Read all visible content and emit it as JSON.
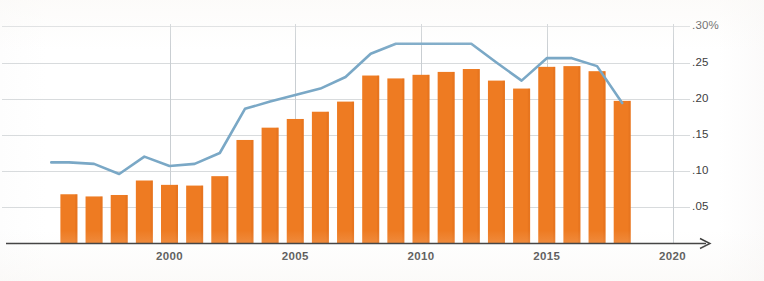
{
  "chart_data": {
    "type": "bar",
    "title": "",
    "subtitle": "",
    "xlabel": "",
    "ylabel": "",
    "grid": true,
    "legend": "none",
    "xlim": [
      1995.2,
      2021.0
    ],
    "ylim": [
      0.0,
      0.305
    ],
    "y_ticks": [
      0.05,
      0.1,
      0.15,
      0.2,
      0.25,
      0.3
    ],
    "y_tick_labels": [
      ".05",
      ".10",
      ".15",
      ".20",
      ".25",
      ".30%"
    ],
    "x_ticks": [
      2000,
      2005,
      2010,
      2015,
      2020
    ],
    "x_tick_labels": [
      "2000",
      "2005",
      "2010",
      "2015",
      "2020"
    ],
    "categories": [
      1996,
      1997,
      1998,
      1999,
      2000,
      2001,
      2002,
      2003,
      2004,
      2005,
      2006,
      2007,
      2008,
      2009,
      2010,
      2011,
      2012,
      2013,
      2014,
      2015,
      2016,
      2017,
      2018
    ],
    "series": [
      {
        "name": "bars",
        "kind": "bar",
        "color": "#ee7b22",
        "values": [
          0.068,
          0.065,
          0.067,
          0.087,
          0.081,
          0.08,
          0.093,
          0.143,
          0.16,
          0.172,
          0.182,
          0.196,
          0.232,
          0.228,
          0.233,
          0.237,
          0.241,
          0.225,
          0.214,
          0.244,
          0.245,
          0.238,
          0.197
        ]
      },
      {
        "name": "line",
        "kind": "line",
        "color": "#7aa8c6",
        "x": [
          1995.3,
          1996,
          1997,
          1998,
          1999,
          2000,
          2001,
          2002,
          2003,
          2004,
          2005,
          2006,
          2007,
          2008,
          2009,
          2010,
          2011,
          2012,
          2013,
          2014,
          2015,
          2016,
          2017,
          2018
        ],
        "values": [
          0.112,
          0.112,
          0.11,
          0.096,
          0.12,
          0.107,
          0.11,
          0.125,
          0.186,
          0.196,
          0.205,
          0.214,
          0.23,
          0.262,
          0.276,
          0.276,
          0.276,
          0.276,
          0.25,
          0.225,
          0.256,
          0.256,
          0.245,
          0.194
        ]
      }
    ],
    "colors": {
      "bar": "#ee7b22",
      "line": "#7aa8c6",
      "gridline": "#d8dbdd",
      "axis": "#2b2b2b",
      "tick_text": "#3d3d3d"
    }
  },
  "axis_labels": {
    "y": [
      {
        "id": "y-tick-30",
        "text": ".30%"
      },
      {
        "id": "y-tick-25",
        "text": ".25"
      },
      {
        "id": "y-tick-20",
        "text": ".20"
      },
      {
        "id": "y-tick-15",
        "text": ".15"
      },
      {
        "id": "y-tick-10",
        "text": ".10"
      },
      {
        "id": "y-tick-05",
        "text": ".05"
      }
    ],
    "x": [
      {
        "id": "x-tick-2000",
        "text": "2000"
      },
      {
        "id": "x-tick-2005",
        "text": "2005"
      },
      {
        "id": "x-tick-2010",
        "text": "2010"
      },
      {
        "id": "x-tick-2015",
        "text": "2015"
      },
      {
        "id": "x-tick-2020",
        "text": "2020"
      }
    ]
  }
}
